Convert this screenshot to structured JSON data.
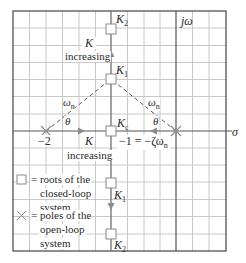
{
  "diagram": {
    "type": "root-locus",
    "axes": {
      "imag_label": "jω",
      "real_label": "σ"
    },
    "ticks": {
      "minus_two": "−2",
      "minus_one": "−1 = −ζω",
      "minus_one_sub": "n"
    },
    "poles": [
      {
        "label": "−2",
        "value": -2
      },
      {
        "label": "0",
        "value": 0
      }
    ],
    "breakaway": {
      "label": "K",
      "sub": "c",
      "value": -1
    },
    "upper_roots": [
      {
        "label": "K",
        "sub": "1"
      },
      {
        "label": "K",
        "sub": "2"
      }
    ],
    "lower_roots": [
      {
        "label": "K",
        "sub": "1"
      },
      {
        "label": "K",
        "sub": "2"
      }
    ],
    "annotations": {
      "k_increasing_top_k": "K",
      "k_increasing_top_text": "increasing",
      "k_increasing_real_k": "K",
      "k_increasing_real_text": "increasing",
      "omega_left": "ω",
      "omega_left_sub": "n",
      "omega_right": "ω",
      "omega_right_sub": "n",
      "theta_left": "θ",
      "theta_right": "θ"
    },
    "legend": {
      "square_line1": "= roots of the",
      "square_line2": "closed-loop",
      "square_line3": "system",
      "cross_line1": "= poles of the",
      "cross_line2": "open-loop",
      "cross_line3": "system"
    },
    "colors": {
      "grid": "#c8c8c8",
      "axis": "#555555",
      "frame": "#444444",
      "locus": "#7a7a7a",
      "marker": "#8a8a8a",
      "text": "#2a2a2a"
    }
  }
}
